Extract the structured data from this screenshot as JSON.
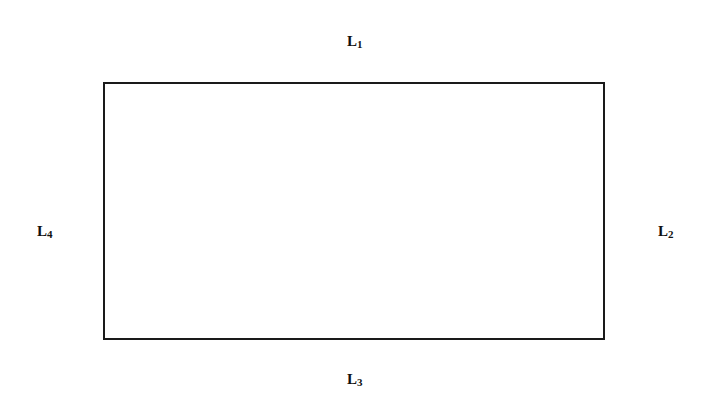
{
  "diagram": {
    "shape": "rectangle",
    "labels": {
      "top": {
        "main": "L",
        "sub": "1"
      },
      "right": {
        "main": "L",
        "sub": "2"
      },
      "bottom": {
        "main": "L",
        "sub": "3"
      },
      "left": {
        "main": "L",
        "sub": "4"
      }
    },
    "stroke_color": "#1a1a1a"
  }
}
